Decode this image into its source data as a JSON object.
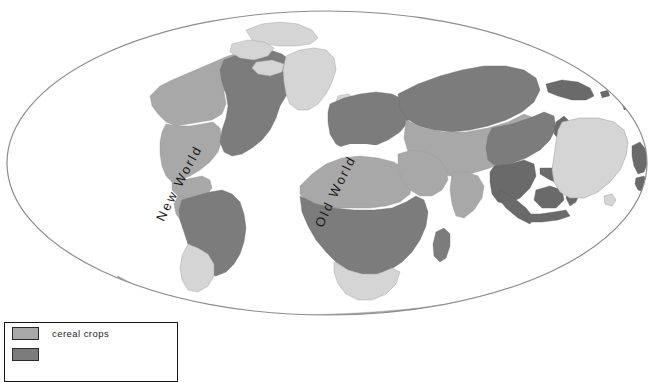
{
  "figure": {
    "kind": "world-map",
    "projection": "Mollweide",
    "background_color": "#ffffff",
    "outline_color": "#8d8d92"
  },
  "map": {
    "labels": [
      {
        "id": "new-world",
        "text": "New World"
      },
      {
        "id": "old-world",
        "text": "Old World"
      }
    ],
    "shade_colors": {
      "light": "#d5d5d5",
      "medium": "#a8a8a8",
      "dark": "#7c7c7c",
      "darkest": "#6a6a6a",
      "outline": "#8d8d92"
    },
    "regions": [
      {
        "name": "greenland",
        "shade": "light"
      },
      {
        "name": "arctic-islands",
        "shade": "light"
      },
      {
        "name": "alaska-canada-north",
        "shade": "medium"
      },
      {
        "name": "north-america-west",
        "shade": "medium"
      },
      {
        "name": "north-america-east",
        "shade": "dark"
      },
      {
        "name": "central-america",
        "shade": "medium"
      },
      {
        "name": "south-america-north",
        "shade": "medium"
      },
      {
        "name": "south-america-main",
        "shade": "dark"
      },
      {
        "name": "south-america-south",
        "shade": "light"
      },
      {
        "name": "europe",
        "shade": "dark"
      },
      {
        "name": "north-africa",
        "shade": "medium"
      },
      {
        "name": "sub-saharan-africa",
        "shade": "dark"
      },
      {
        "name": "southern-africa",
        "shade": "light"
      },
      {
        "name": "madagascar",
        "shade": "dark"
      },
      {
        "name": "middle-east",
        "shade": "medium"
      },
      {
        "name": "central-asia",
        "shade": "medium"
      },
      {
        "name": "siberia",
        "shade": "dark"
      },
      {
        "name": "india",
        "shade": "medium"
      },
      {
        "name": "east-asia",
        "shade": "dark"
      },
      {
        "name": "southeast-asia",
        "shade": "darkest"
      },
      {
        "name": "indonesia",
        "shade": "darkest"
      },
      {
        "name": "new-guinea",
        "shade": "darkest"
      },
      {
        "name": "australia",
        "shade": "light"
      },
      {
        "name": "new-zealand",
        "shade": "darkest"
      },
      {
        "name": "antarctica",
        "shade": "medium"
      }
    ]
  },
  "legend": {
    "items": [
      {
        "label": "cereal crops",
        "swatch_color": "#a8a8a8"
      },
      {
        "label": "",
        "swatch_color": "#7c7c7c"
      }
    ]
  },
  "caption": {
    "text": ""
  }
}
